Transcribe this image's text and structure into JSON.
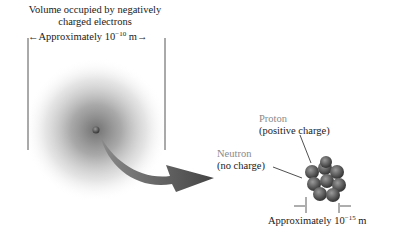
{
  "atom": {
    "title_line1": "Volume occupied by negatively",
    "title_line2": "charged electrons",
    "size_prefix": "Approximately 10",
    "size_exp": "−10",
    "size_unit": " m"
  },
  "nucleus": {
    "proton_label": "Proton",
    "proton_desc": "(positive charge)",
    "neutron_label": "Neutron",
    "neutron_desc": "(no charge)",
    "size_prefix": "Approximately 10",
    "size_exp": "−15",
    "size_unit": " m"
  },
  "colors": {
    "cloud": "#6f6f6f",
    "arrow": "#5a5a5a",
    "label_gray": "#8a8a8a",
    "nucleus": "#555555"
  }
}
